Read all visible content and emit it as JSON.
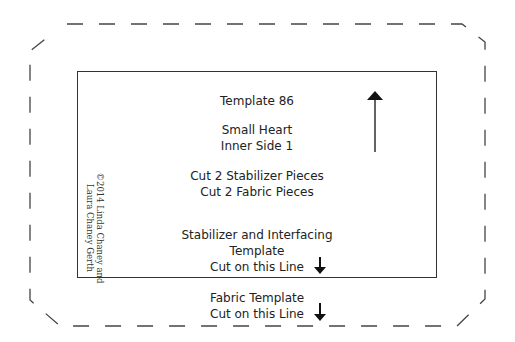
{
  "template": {
    "number_label": "Template 86",
    "piece_name_line1": "Small Heart",
    "piece_name_line2": "Inner Side 1",
    "cut_instruction_line1": "Cut 2 Stabilizer Pieces",
    "cut_instruction_line2": "Cut 2 Fabric Pieces",
    "stabilizer_label_line1": "Stabilizer and Interfacing",
    "stabilizer_label_line2": "Template",
    "stabilizer_label_line3": "Cut on this Line",
    "fabric_label_line1": "Fabric Template",
    "fabric_label_line2": "Cut on this Line"
  },
  "copyright": {
    "line1": "©2014 Linda Chaney and",
    "line2": "Laura Chaney Gerth"
  },
  "icons": {
    "grain_arrow": "arrow-up-icon",
    "stabilizer_cut_arrow": "arrow-down-icon",
    "fabric_cut_arrow": "arrow-down-icon"
  },
  "colors": {
    "line": "#333333",
    "background": "#ffffff"
  }
}
